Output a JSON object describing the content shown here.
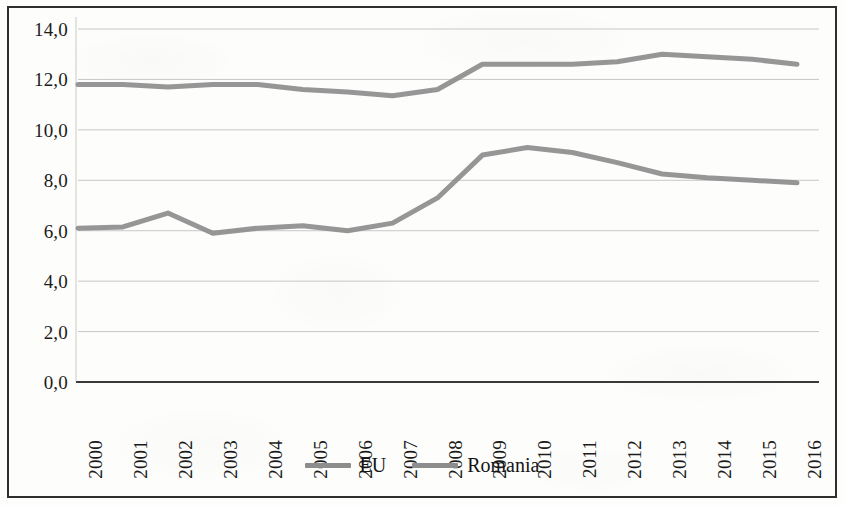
{
  "chart_data": {
    "type": "line",
    "title": "",
    "subtitle": "",
    "xlabel": "",
    "ylabel": "",
    "categories": [
      "2000",
      "2001",
      "2002",
      "2003",
      "2004",
      "2005",
      "2006",
      "2007",
      "2008",
      "2009",
      "2010",
      "2011",
      "2012",
      "2013",
      "2014",
      "2015",
      "2016"
    ],
    "series": [
      {
        "name": "EU",
        "color": "#8d8d8d",
        "values": [
          11.8,
          11.8,
          11.7,
          11.8,
          11.8,
          11.6,
          11.5,
          11.35,
          11.6,
          12.6,
          12.6,
          12.6,
          12.7,
          13.0,
          12.9,
          12.8,
          12.6
        ]
      },
      {
        "name": "Romania",
        "color": "#8d8d8d",
        "values": [
          6.1,
          6.15,
          6.7,
          5.9,
          6.1,
          6.2,
          6.0,
          6.3,
          7.3,
          9.0,
          9.3,
          9.1,
          8.7,
          8.25,
          8.1,
          8.0,
          7.9
        ]
      }
    ],
    "ylim": [
      0.0,
      14.0
    ],
    "ytick_labels": [
      "0,0",
      "2,0",
      "4,0",
      "6,0",
      "8,0",
      "10,0",
      "12,0",
      "14,0"
    ],
    "ytick_values": [
      0,
      2,
      4,
      6,
      8,
      10,
      12,
      14
    ],
    "grid": "horizontal",
    "legend_position": "bottom-center",
    "decimal_separator": ",",
    "gridline_color": "#bfbfbf",
    "axis_color": "#4a4a4a",
    "frame_color": "#2e2e2e",
    "background_color": "#fdfdfc"
  },
  "legend": {
    "entries": [
      {
        "label": "EU"
      },
      {
        "label": "Romania"
      }
    ]
  }
}
